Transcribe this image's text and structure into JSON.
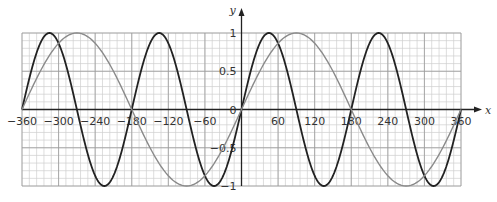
{
  "chart_data": {
    "type": "line",
    "title": "",
    "xlabel": "x",
    "ylabel": "y",
    "xlim": [
      -360,
      360
    ],
    "ylim": [
      -1,
      1
    ],
    "grid": true,
    "x_major_step": 60,
    "x_minor_step": 12,
    "y_major_step": 0.5,
    "y_minor_step": 0.1,
    "x_ticks": [
      -360,
      -300,
      -240,
      -180,
      -120,
      -60,
      0,
      60,
      120,
      180,
      240,
      300,
      360
    ],
    "x_tick_labels": [
      "−360",
      "−300",
      "−240",
      "−180",
      "−120",
      "−60",
      "0",
      "60",
      "120",
      "180",
      "240",
      "300",
      "360"
    ],
    "y_ticks": [
      1,
      0.5,
      0,
      -0.5,
      -1
    ],
    "y_tick_labels": [
      "1",
      "0.5",
      "0",
      "−0.5",
      "−1"
    ],
    "series": [
      {
        "name": "y = sin 2x",
        "color": "#222222",
        "width": 1.8,
        "x": [
          -360,
          -315,
          -270,
          -225,
          -180,
          -135,
          -90,
          -45,
          0,
          45,
          90,
          135,
          180,
          225,
          270,
          315,
          360
        ],
        "values": [
          0,
          1,
          0,
          -1,
          0,
          1,
          0,
          -1,
          0,
          1,
          0,
          -1,
          0,
          1,
          0,
          -1,
          0
        ]
      },
      {
        "name": "y = sin x",
        "color": "#8a8a8a",
        "width": 1.4,
        "x": [
          -360,
          -270,
          -180,
          -90,
          0,
          90,
          180,
          270,
          360
        ],
        "values": [
          0,
          1,
          0,
          -1,
          0,
          1,
          0,
          -1,
          0
        ]
      }
    ]
  },
  "colors": {
    "grid_minor": "#cfcfcf",
    "grid_major": "#9a9a9a",
    "axis": "#222222"
  }
}
